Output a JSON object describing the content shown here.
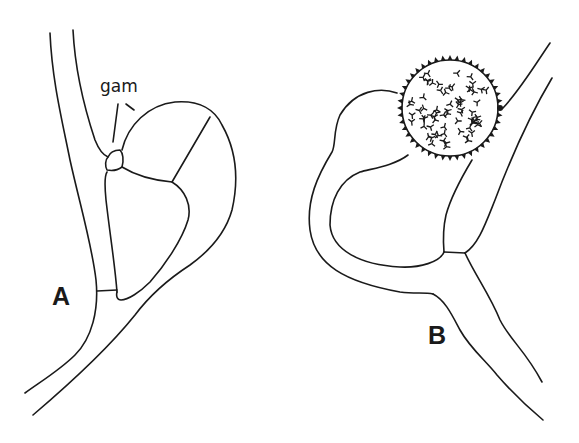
{
  "figure": {
    "panels": [
      {
        "id": "A",
        "label": "A",
        "annotations": [
          {
            "text": "gam"
          }
        ]
      },
      {
        "id": "B",
        "label": "B",
        "annotations": []
      }
    ],
    "colors": {
      "line": "#1a1a1a",
      "background": "#ffffff"
    }
  }
}
